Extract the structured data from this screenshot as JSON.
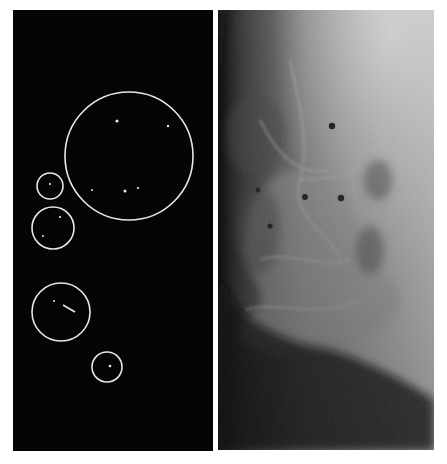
{
  "figure": {
    "left_panel": {
      "label": "Annotated detection map",
      "background": "#050505",
      "stroke_color": "#e8e8e8",
      "circles": [
        {
          "cx": 129,
          "cy": 156,
          "r": 64
        },
        {
          "cx": 50,
          "cy": 186,
          "r": 13
        },
        {
          "cx": 53,
          "cy": 228,
          "r": 21
        },
        {
          "cx": 61,
          "cy": 312,
          "r": 29
        },
        {
          "cx": 107,
          "cy": 367,
          "r": 15
        }
      ],
      "dots": [
        {
          "x": 117,
          "y": 121,
          "r": 1.6
        },
        {
          "x": 168,
          "y": 126,
          "r": 1.2
        },
        {
          "x": 92,
          "y": 190,
          "r": 1.0
        },
        {
          "x": 125,
          "y": 191,
          "r": 1.5
        },
        {
          "x": 138,
          "y": 188,
          "r": 1.1
        },
        {
          "x": 50,
          "y": 184,
          "r": 1.1
        },
        {
          "x": 60,
          "y": 217,
          "r": 1.1
        },
        {
          "x": 43,
          "y": 236,
          "r": 1.0
        },
        {
          "x": 54,
          "y": 301,
          "r": 1.0
        },
        {
          "x": 110,
          "y": 366,
          "r": 1.3
        }
      ],
      "segments": [
        {
          "x1": 63,
          "y1": 305,
          "x2": 75,
          "y2": 312
        }
      ]
    },
    "right_panel": {
      "label": "Mammogram image",
      "spots": [
        {
          "x": 332,
          "y": 126,
          "r": 3.2
        },
        {
          "x": 305,
          "y": 197,
          "r": 3.0
        },
        {
          "x": 341,
          "y": 198,
          "r": 3.2
        },
        {
          "x": 258,
          "y": 190,
          "r": 2.4
        },
        {
          "x": 270,
          "y": 226,
          "r": 2.6
        }
      ]
    }
  }
}
